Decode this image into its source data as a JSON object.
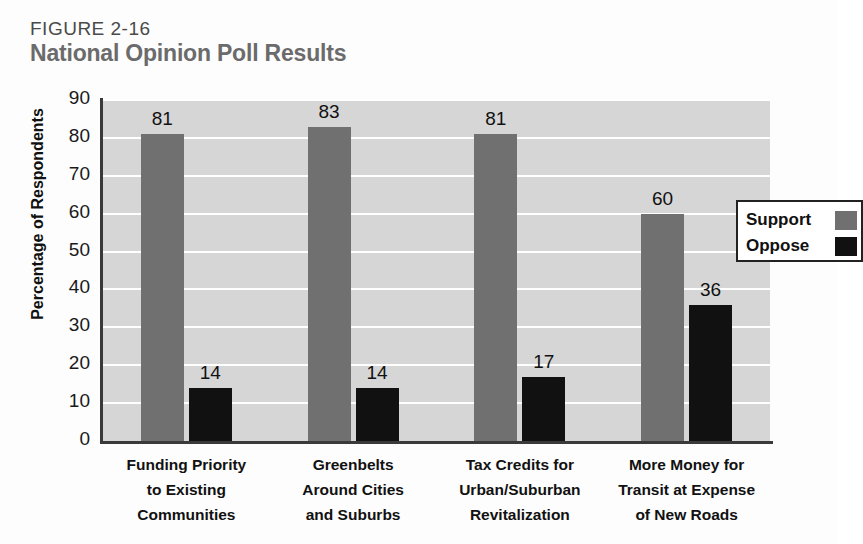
{
  "figure": {
    "number": "FIGURE 2-16",
    "title": "National Opinion Poll Results"
  },
  "colors": {
    "support": "#707070",
    "oppose": "#111111",
    "plot_background": "#d6d6d6",
    "gridline": "#ffffff",
    "title": "#6b6b6b",
    "figure_number": "#4a4a4a"
  },
  "chart_data": {
    "type": "bar",
    "title": "National Opinion Poll Results",
    "xlabel": "",
    "ylabel": "Percentage of Respondents",
    "ylim": [
      0,
      90
    ],
    "yticks": [
      0,
      10,
      20,
      30,
      40,
      50,
      60,
      70,
      80,
      90
    ],
    "grid": true,
    "legend_position": "top-right",
    "categories": [
      "Funding Priority to Existing Communities",
      "Greenbelts Around Cities and Suburbs",
      "Tax Credits for Urban/Suburban Revitalization",
      "More Money for Transit at Expense of New Roads"
    ],
    "category_lines": [
      [
        "Funding Priority",
        "to Existing",
        "Communities"
      ],
      [
        "Greenbelts",
        "Around Cities",
        "and Suburbs"
      ],
      [
        "Tax Credits for",
        "Urban/Suburban",
        "Revitalization"
      ],
      [
        "More Money for",
        "Transit at Expense",
        "of New Roads"
      ]
    ],
    "series": [
      {
        "name": "Support",
        "color": "#707070",
        "values": [
          81,
          83,
          81,
          60
        ]
      },
      {
        "name": "Oppose",
        "color": "#111111",
        "values": [
          14,
          14,
          17,
          36
        ]
      }
    ]
  },
  "legend": {
    "items": [
      {
        "label": "Support",
        "swatch": "#707070"
      },
      {
        "label": "Oppose",
        "swatch": "#111111"
      }
    ]
  },
  "yticks_text": [
    "90",
    "80",
    "70",
    "60",
    "50",
    "40",
    "30",
    "20",
    "10",
    "0"
  ]
}
